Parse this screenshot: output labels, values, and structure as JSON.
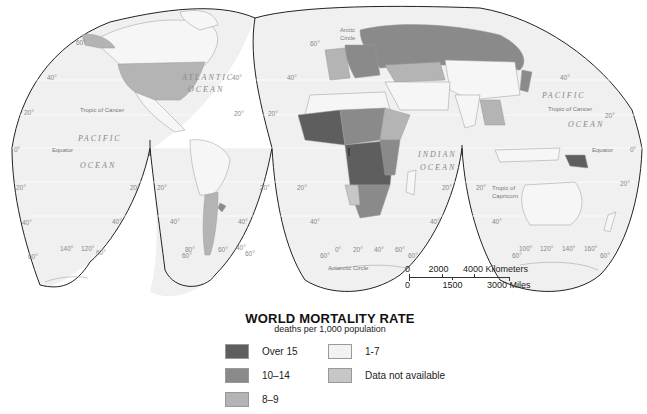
{
  "title": "WORLD MORTALITY RATE",
  "subtitle": "deaths per 1,000 population",
  "legend": [
    {
      "label": "Over 15",
      "color": "#5e5e5e"
    },
    {
      "label": "10–14",
      "color": "#8a8a8a"
    },
    {
      "label": "8–9",
      "color": "#b4b4b4"
    },
    {
      "label": "1-7",
      "color": "#f2f2f2"
    },
    {
      "label": "Data not available",
      "color": "#c6c6c6"
    }
  ],
  "scale_bar": {
    "km_labels": [
      "0",
      "2000",
      "4000 Kilometers"
    ],
    "mile_labels": [
      "0",
      "1500",
      "3000 Miles"
    ]
  },
  "map_labels": {
    "oceans": {
      "atlantic_1": "ATLANTIC",
      "atlantic_2": "OCEAN",
      "pacific_w_1": "PACIFIC",
      "pacific_w_2": "OCEAN",
      "indian_1": "INDIAN",
      "indian_2": "OCEAN",
      "pacific_e_1": "PACIFIC",
      "pacific_e_2": "OCEAN"
    },
    "lines": {
      "tropic_cancer_w": "Tropic of Cancer",
      "tropic_cancer_e": "Tropic of Cancer",
      "equator_w": "Equator",
      "equator_e": "Equator",
      "tropic_capricorn_1": "Tropic of",
      "tropic_capricorn_2": "Capricorn",
      "arctic_1": "Arctic",
      "arctic_2": "Circle",
      "antarctic": "Antarctic Circle"
    },
    "latitudes": {
      "n60": "60°",
      "n40": "40°",
      "n20": "20°",
      "eq": "0°",
      "s20": "20°",
      "s40": "40°",
      "s60": "60°"
    },
    "longitudes": {
      "w140": "140°",
      "w120": "120°",
      "w80": "80°",
      "w60": "60°",
      "w40": "40°",
      "e0": "0°",
      "e20": "20°",
      "e40": "40°",
      "e60": "60°",
      "e100": "100°",
      "e120": "120°",
      "e140": "140°",
      "e160": "160°"
    }
  }
}
